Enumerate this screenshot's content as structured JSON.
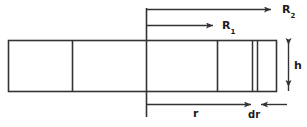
{
  "figure": {
    "name": "annular-element-cross-section-diagram",
    "type": "technical-line-diagram",
    "stroke_color": "#333333",
    "background_color": "#ffffff",
    "labels": {
      "r2_base": "R",
      "r2_sub": "2",
      "r1_base": "R",
      "r1_sub": "1",
      "height": "h",
      "radius": "r",
      "differential_radius": "dr"
    },
    "dimension_lines": [
      {
        "id": "r2-dimension",
        "label": "R2",
        "orientation": "horizontal",
        "arrowhead": "end",
        "from_x": 146,
        "to_x": 272,
        "y": 10
      },
      {
        "id": "r1-dimension",
        "label": "R1",
        "orientation": "horizontal",
        "arrowhead": "end",
        "from_x": 146,
        "to_x": 214,
        "y": 26
      },
      {
        "id": "r-dimension",
        "label": "r",
        "orientation": "horizontal",
        "arrowhead": "end",
        "from_x": 146,
        "to_x": 252,
        "y": 105
      },
      {
        "id": "dr-dimension",
        "label": "dr",
        "orientation": "horizontal",
        "arrowhead": "both-inward",
        "from_x": 252,
        "to_x": 285,
        "y": 105
      },
      {
        "id": "h-dimension",
        "label": "h",
        "orientation": "vertical",
        "arrowhead": "both",
        "x": 288,
        "from_y": 41,
        "to_y": 91
      }
    ],
    "body_rect": {
      "id": "slab-outline",
      "x": 8,
      "y": 40,
      "width": 269,
      "height": 52
    },
    "internal_dividers": [
      {
        "id": "divider-1",
        "x": 72
      },
      {
        "id": "divider-axis",
        "x": 146
      },
      {
        "id": "divider-2",
        "x": 217
      },
      {
        "id": "divider-dr-left",
        "x": 252
      },
      {
        "id": "divider-dr-right",
        "x": 257
      }
    ],
    "reference_axis": {
      "id": "vertical-reference-axis",
      "x": 146,
      "from_y": 8,
      "to_y": 117
    }
  }
}
